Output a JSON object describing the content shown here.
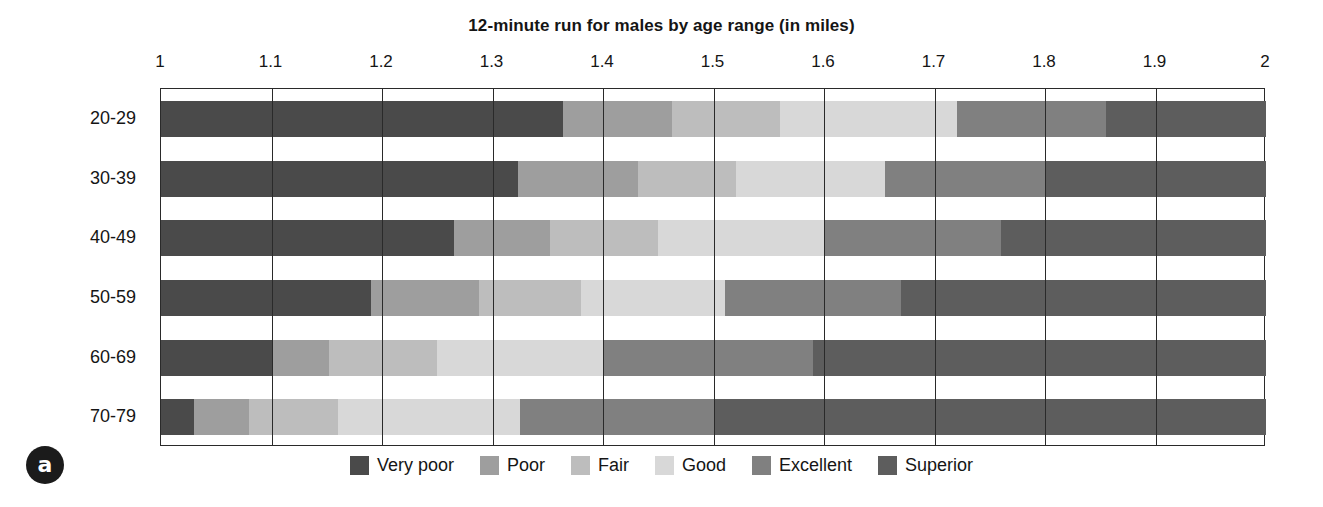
{
  "figure": {
    "panel_label": "a",
    "title": "12-minute run for males by age range (in miles)"
  },
  "legend": {
    "position": "bottom-center",
    "items": [
      {
        "label": "Very poor",
        "color": "#4a4a4a"
      },
      {
        "label": "Poor",
        "color": "#9e9e9e"
      },
      {
        "label": "Fair",
        "color": "#bdbdbd"
      },
      {
        "label": "Good",
        "color": "#d8d8d8"
      },
      {
        "label": "Excellent",
        "color": "#808080"
      },
      {
        "label": "Superior",
        "color": "#5d5d5d"
      }
    ]
  },
  "chart_data": {
    "type": "bar",
    "orientation": "horizontal",
    "stacked": true,
    "title": "12-minute run for males by age range (in miles)",
    "xlabel": "",
    "ylabel": "",
    "xlim": [
      1,
      2
    ],
    "grid": true,
    "xticks": [
      1,
      1.1,
      1.2,
      1.3,
      1.4,
      1.5,
      1.6,
      1.7,
      1.8,
      1.9,
      2
    ],
    "xtick_labels": [
      "1",
      "1.1",
      "1.2",
      "1.3",
      "1.4",
      "1.5",
      "1.6",
      "1.7",
      "1.8",
      "1.9",
      "2"
    ],
    "categories": [
      "20-29",
      "30-39",
      "40-49",
      "50-59",
      "60-69",
      "70-79"
    ],
    "series": [
      {
        "name": "Very poor",
        "color": "#4a4a4a",
        "starts": [
          1.0,
          1.0,
          1.0,
          1.0,
          1.0,
          1.0
        ],
        "ends": [
          1.364,
          1.323,
          1.265,
          1.19,
          1.1,
          1.03
        ]
      },
      {
        "name": "Poor",
        "color": "#9e9e9e",
        "starts": [
          1.364,
          1.323,
          1.265,
          1.19,
          1.1,
          1.03
        ],
        "ends": [
          1.462,
          1.432,
          1.352,
          1.288,
          1.152,
          1.08
        ]
      },
      {
        "name": "Fair",
        "color": "#bdbdbd",
        "starts": [
          1.462,
          1.432,
          1.352,
          1.288,
          1.152,
          1.08
        ],
        "ends": [
          1.56,
          1.52,
          1.45,
          1.38,
          1.25,
          1.16
        ]
      },
      {
        "name": "Good",
        "color": "#d8d8d8",
        "starts": [
          1.56,
          1.52,
          1.45,
          1.38,
          1.25,
          1.16
        ],
        "ends": [
          1.72,
          1.655,
          1.6,
          1.51,
          1.4,
          1.325
        ]
      },
      {
        "name": "Excellent",
        "color": "#808080",
        "starts": [
          1.72,
          1.655,
          1.6,
          1.51,
          1.4,
          1.325
        ],
        "ends": [
          1.855,
          1.8,
          1.76,
          1.67,
          1.59,
          1.5
        ]
      },
      {
        "name": "Superior",
        "color": "#5d5d5d",
        "starts": [
          1.855,
          1.8,
          1.76,
          1.67,
          1.59,
          1.5
        ],
        "ends": [
          2.0,
          2.0,
          2.0,
          2.0,
          2.0,
          2.0
        ]
      }
    ]
  }
}
